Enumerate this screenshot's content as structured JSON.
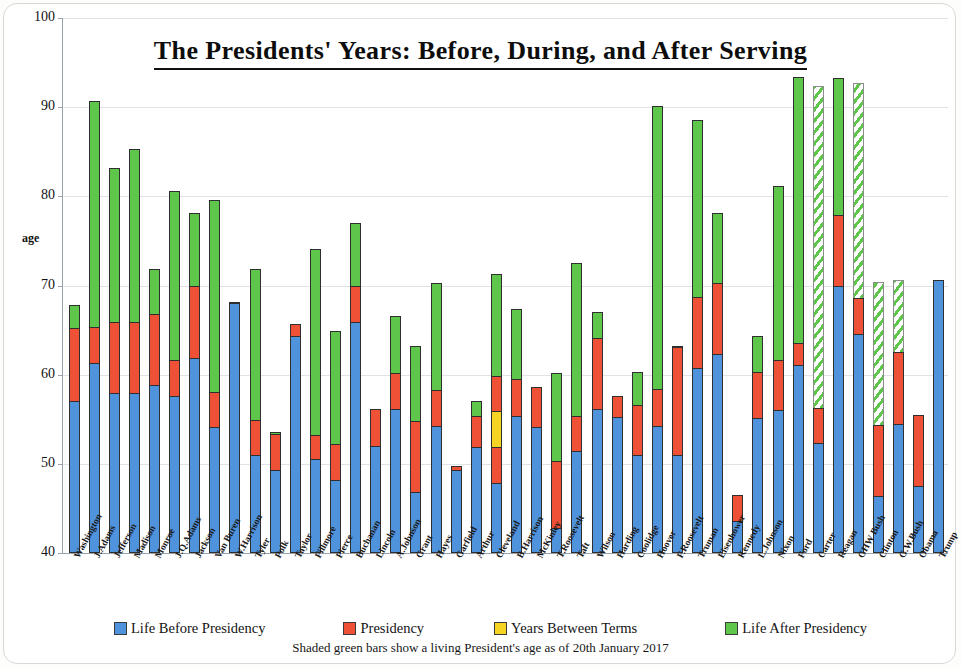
{
  "chart_data": {
    "type": "bar",
    "stacked": true,
    "title": "The Presidents' Years:  Before, During, and After Serving",
    "xlabel": "",
    "ylabel": "age",
    "ylim": [
      40,
      100
    ],
    "yticks": [
      40,
      50,
      60,
      70,
      80,
      90,
      100
    ],
    "grid": true,
    "legend_position": "bottom",
    "footnote": "Shaded green bars show a living President's age as of 20th January 2017",
    "series": [
      {
        "name": "Life Before Presidency",
        "key": "before",
        "color": "#4f93dd"
      },
      {
        "name": "Presidency",
        "key": "term",
        "color": "#ef5136"
      },
      {
        "name": "Years Between Terms",
        "key": "gap",
        "color": "#f5d424"
      },
      {
        "name": "Life After Presidency",
        "key": "after",
        "color": "#5fc64c"
      }
    ],
    "categories": [
      "Washington",
      "J.Adams",
      "Jefferson",
      "Madison",
      "Monroe",
      "J.Q.Adams",
      "Jackson",
      "Van Buren",
      "W.Harrison",
      "Tyler",
      "Polk",
      "Taylor",
      "Fillmore",
      "Pierce",
      "Buchanan",
      "Lincoln",
      "A.Johnson",
      "Grant",
      "Hayes",
      "Garfield",
      "Arthur",
      "Cleveland",
      "B.Harrison",
      "McKinley",
      "T.Roosevelt",
      "Taft",
      "Wilson",
      "Harding",
      "Coolidge",
      "Hoover",
      "F.Roosevelt",
      "Truman",
      "Eisenhower",
      "Kennedy",
      "L.Johnson",
      "Nixon",
      "Ford",
      "Carter",
      "Reagan",
      "GHW Bush",
      "Clinton",
      "G.W.Bush",
      "Obama",
      "Trump"
    ],
    "bars": [
      {
        "label": "Washington",
        "start": 57.1,
        "end_term": 65.2,
        "gap_end": null,
        "end_life": 67.8,
        "living": false
      },
      {
        "label": "J.Adams",
        "start": 61.3,
        "end_term": 65.4,
        "gap_end": null,
        "end_life": 90.7,
        "living": false
      },
      {
        "label": "Jefferson",
        "start": 57.9,
        "end_term": 65.9,
        "gap_end": null,
        "end_life": 83.2,
        "living": false
      },
      {
        "label": "Madison",
        "start": 57.9,
        "end_term": 65.9,
        "gap_end": null,
        "end_life": 85.3,
        "living": false
      },
      {
        "label": "Monroe",
        "start": 58.8,
        "end_term": 66.8,
        "gap_end": null,
        "end_life": 71.9,
        "living": false
      },
      {
        "label": "J.Q.Adams",
        "start": 57.6,
        "end_term": 61.6,
        "gap_end": null,
        "end_life": 80.6,
        "living": false
      },
      {
        "label": "Jackson",
        "start": 61.9,
        "end_term": 69.9,
        "gap_end": null,
        "end_life": 78.1,
        "living": false
      },
      {
        "label": "Van Buren",
        "start": 54.1,
        "end_term": 58.1,
        "gap_end": null,
        "end_life": 79.6,
        "living": false
      },
      {
        "label": "W.Harrison",
        "start": 68.0,
        "end_term": 68.1,
        "gap_end": null,
        "end_life": 68.1,
        "living": false
      },
      {
        "label": "Tyler",
        "start": 51.0,
        "end_term": 54.9,
        "gap_end": null,
        "end_life": 71.9,
        "living": false
      },
      {
        "label": "Polk",
        "start": 49.3,
        "end_term": 53.3,
        "gap_end": null,
        "end_life": 53.6,
        "living": false
      },
      {
        "label": "Taylor",
        "start": 64.3,
        "end_term": 65.7,
        "gap_end": null,
        "end_life": 65.7,
        "living": false
      },
      {
        "label": "Fillmore",
        "start": 50.5,
        "end_term": 53.2,
        "gap_end": null,
        "end_life": 74.1,
        "living": false
      },
      {
        "label": "Pierce",
        "start": 48.2,
        "end_term": 52.2,
        "gap_end": null,
        "end_life": 64.9,
        "living": false
      },
      {
        "label": "Buchanan",
        "start": 65.9,
        "end_term": 69.9,
        "gap_end": null,
        "end_life": 77.0,
        "living": false
      },
      {
        "label": "Lincoln",
        "start": 52.0,
        "end_term": 56.2,
        "gap_end": null,
        "end_life": 56.2,
        "living": false
      },
      {
        "label": "A.Johnson",
        "start": 56.2,
        "end_term": 60.2,
        "gap_end": null,
        "end_life": 66.6,
        "living": false
      },
      {
        "label": "Grant",
        "start": 46.8,
        "end_term": 54.8,
        "gap_end": null,
        "end_life": 63.2,
        "living": false
      },
      {
        "label": "Hayes",
        "start": 54.3,
        "end_term": 58.3,
        "gap_end": null,
        "end_life": 70.3,
        "living": false
      },
      {
        "label": "Garfield",
        "start": 49.3,
        "end_term": 49.8,
        "gap_end": null,
        "end_life": 49.8,
        "living": false
      },
      {
        "label": "Arthur",
        "start": 51.9,
        "end_term": 55.4,
        "gap_end": null,
        "end_life": 57.0,
        "living": false
      },
      {
        "label": "Cleveland",
        "start": 47.9,
        "end_term": 51.9,
        "gap_end": 55.9,
        "end_life": 71.3,
        "living": false
      },
      {
        "label": "B.Harrison",
        "start": 55.4,
        "end_term": 59.5,
        "gap_end": null,
        "end_life": 67.4,
        "living": false
      },
      {
        "label": "McKinley",
        "start": 54.1,
        "end_term": 58.6,
        "gap_end": null,
        "end_life": 58.6,
        "living": false
      },
      {
        "label": "T.Roosevelt",
        "start": 42.8,
        "end_term": 50.3,
        "gap_end": null,
        "end_life": 60.2,
        "living": false
      },
      {
        "label": "Taft",
        "start": 51.4,
        "end_term": 55.4,
        "gap_end": null,
        "end_life": 72.5,
        "living": false
      },
      {
        "label": "Wilson",
        "start": 56.1,
        "end_term": 64.1,
        "gap_end": null,
        "end_life": 67.0,
        "living": false
      },
      {
        "label": "Harding",
        "start": 55.3,
        "end_term": 57.6,
        "gap_end": null,
        "end_life": 57.6,
        "living": false
      },
      {
        "label": "Coolidge",
        "start": 51.0,
        "end_term": 56.6,
        "gap_end": null,
        "end_life": 60.3,
        "living": false
      },
      {
        "label": "Hoover",
        "start": 54.3,
        "end_term": 58.4,
        "gap_end": null,
        "end_life": 90.1,
        "living": false
      },
      {
        "label": "F.Roosevelt",
        "start": 51.0,
        "end_term": 63.1,
        "gap_end": null,
        "end_life": 63.2,
        "living": false
      },
      {
        "label": "Truman",
        "start": 60.7,
        "end_term": 68.7,
        "gap_end": null,
        "end_life": 88.6,
        "living": false
      },
      {
        "label": "Eisenhower",
        "start": 62.3,
        "end_term": 70.3,
        "gap_end": null,
        "end_life": 78.1,
        "living": false
      },
      {
        "label": "Kennedy",
        "start": 43.6,
        "end_term": 46.5,
        "gap_end": null,
        "end_life": 46.5,
        "living": false
      },
      {
        "label": "L.Johnson",
        "start": 55.1,
        "end_term": 60.3,
        "gap_end": null,
        "end_life": 64.3,
        "living": false
      },
      {
        "label": "Nixon",
        "start": 56.0,
        "end_term": 61.6,
        "gap_end": null,
        "end_life": 81.2,
        "living": false
      },
      {
        "label": "Ford",
        "start": 61.1,
        "end_term": 63.5,
        "gap_end": null,
        "end_life": 93.4,
        "living": false
      },
      {
        "label": "Carter",
        "start": 52.3,
        "end_term": 56.3,
        "gap_end": null,
        "end_life": 92.4,
        "living": true
      },
      {
        "label": "Reagan",
        "start": 69.9,
        "end_term": 77.9,
        "gap_end": null,
        "end_life": 93.3,
        "living": false
      },
      {
        "label": "GHW Bush",
        "start": 64.6,
        "end_term": 68.6,
        "gap_end": null,
        "end_life": 92.7,
        "living": true
      },
      {
        "label": "Clinton",
        "start": 46.4,
        "end_term": 54.4,
        "gap_end": null,
        "end_life": 70.4,
        "living": true
      },
      {
        "label": "G.W.Bush",
        "start": 54.5,
        "end_term": 62.5,
        "gap_end": null,
        "end_life": 70.6,
        "living": true
      },
      {
        "label": "Obama",
        "start": 47.5,
        "end_term": 55.5,
        "gap_end": null,
        "end_life": 55.5,
        "living": false
      },
      {
        "label": "Trump",
        "start": 70.6,
        "end_term": 70.6,
        "gap_end": null,
        "end_life": 70.6,
        "living": false
      }
    ]
  },
  "title": {
    "text": "The Presidents' Years:  Before, During, and After Serving"
  },
  "axis": {
    "y_title": "age",
    "y_ticks": [
      "100",
      "90",
      "80",
      "70",
      "60",
      "50",
      "40"
    ]
  },
  "legend": {
    "items": [
      {
        "label": "Life Before Presidency",
        "color": "#4f93dd"
      },
      {
        "label": "Presidency",
        "color": "#ef5136"
      },
      {
        "label": "Years Between Terms",
        "color": "#f5d424"
      },
      {
        "label": "Life After Presidency",
        "color": "#5fc64c"
      }
    ]
  },
  "footnote": {
    "text": "Shaded green bars show a living President's age as of 20th January 2017"
  }
}
